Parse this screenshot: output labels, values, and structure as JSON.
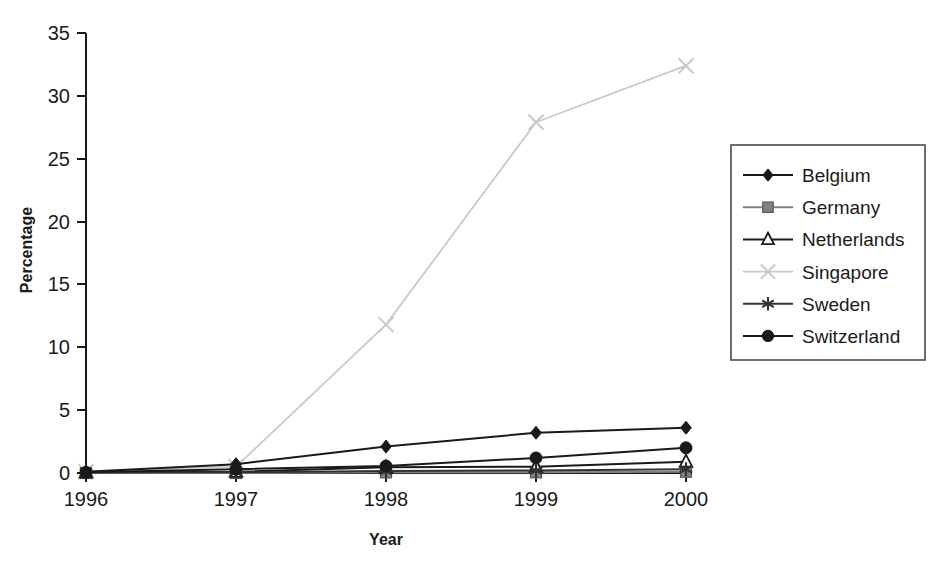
{
  "chart_data": {
    "type": "line",
    "title": "",
    "xlabel": "Year",
    "ylabel": "Percentage",
    "categories": [
      "1996",
      "1997",
      "1998",
      "1999",
      "2000"
    ],
    "x": [
      1996,
      1997,
      1998,
      1999,
      2000
    ],
    "xlim": [
      1996,
      2000
    ],
    "ylim": [
      0,
      35
    ],
    "yticks": [
      0,
      5,
      10,
      15,
      20,
      25,
      30,
      35
    ],
    "ytick_labels": [
      "0",
      "5",
      "10",
      "15",
      "20",
      "25",
      "30",
      "35"
    ],
    "grid": false,
    "legend_position": "right",
    "series": [
      {
        "name": "Belgium",
        "marker": "diamond",
        "color": "#1a1a1a",
        "values": [
          0.1,
          0.7,
          2.1,
          3.2,
          3.6
        ]
      },
      {
        "name": "Germany",
        "marker": "square",
        "color": "#808080",
        "values": [
          0.0,
          0.0,
          0.05,
          0.05,
          0.1
        ]
      },
      {
        "name": "Netherlands",
        "marker": "triangle-open",
        "color": "#1a1a1a",
        "values": [
          0.05,
          0.1,
          0.45,
          0.5,
          0.9
        ]
      },
      {
        "name": "Singapore",
        "marker": "x",
        "color": "#c9c9c9",
        "values": [
          0.1,
          0.5,
          11.8,
          27.9,
          32.4
        ]
      },
      {
        "name": "Sweden",
        "marker": "asterisk",
        "color": "#333333",
        "values": [
          0.05,
          0.05,
          0.15,
          0.2,
          0.3
        ]
      },
      {
        "name": "Switzerland",
        "marker": "circle",
        "color": "#1a1a1a",
        "values": [
          0.05,
          0.3,
          0.55,
          1.2,
          2.0
        ]
      }
    ]
  },
  "axes": {
    "y_title": "Percentage",
    "x_title": "Year"
  },
  "legend": {
    "items": [
      {
        "label": "Belgium"
      },
      {
        "label": "Germany"
      },
      {
        "label": "Netherlands"
      },
      {
        "label": "Singapore"
      },
      {
        "label": "Sweden"
      },
      {
        "label": "Switzerland"
      }
    ]
  },
  "colors": {
    "axis": "#1a1a1a",
    "background": "#ffffff",
    "legend_border": "#4a4a4a"
  }
}
